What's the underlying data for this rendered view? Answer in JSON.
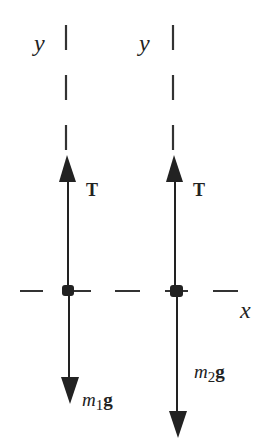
{
  "diagram": {
    "colors": {
      "ink": "#222222",
      "background": "#ffffff"
    },
    "axes": {
      "y_label": "y",
      "x_label": "x"
    },
    "bodies": [
      {
        "name": "mass-1",
        "tension_label": "T",
        "weight_label_m": "m",
        "weight_label_sub": "1",
        "weight_label_g": "g"
      },
      {
        "name": "mass-2",
        "tension_label": "T",
        "weight_label_m": "m",
        "weight_label_sub": "2",
        "weight_label_g": "g"
      }
    ]
  }
}
